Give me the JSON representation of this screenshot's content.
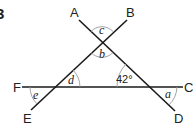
{
  "question_number": "3",
  "points": {
    "A": "A",
    "B": "B",
    "C": "C",
    "D": "D",
    "E": "E",
    "F": "F"
  },
  "angles": {
    "a": "a",
    "b": "b",
    "c": "c",
    "d": "d",
    "e": "e",
    "given": "42°"
  },
  "colors": {
    "line": "#1a1a1a",
    "arc": "#9a9a9a",
    "text": "#222222"
  }
}
